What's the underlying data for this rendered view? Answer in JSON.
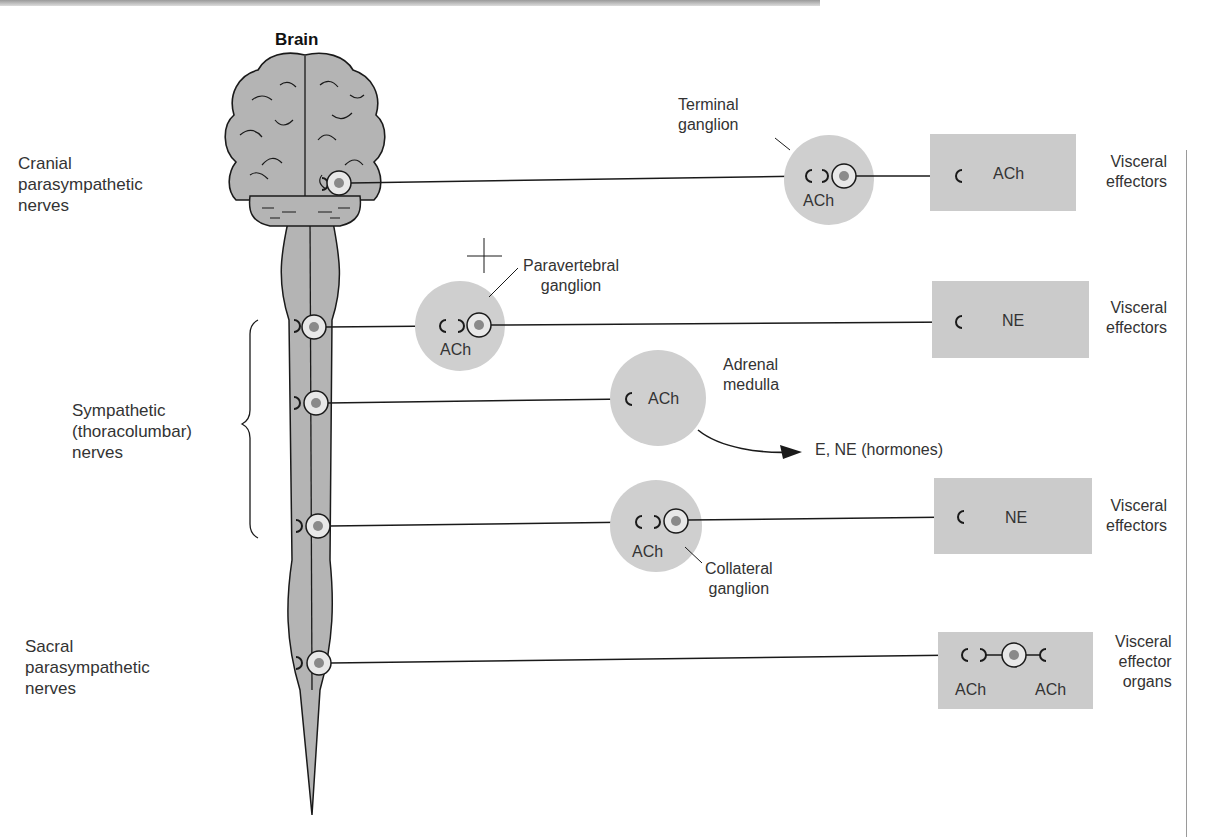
{
  "title": "Brain",
  "colors": {
    "background": "#ffffff",
    "tissue_gray": "#b4b4b4",
    "ganglion_gray": "#cfcfcf",
    "effector_box_gray": "#cbcbcb",
    "cell_body_fill": "#e8e8e8",
    "nucleus": "#8a8a8a",
    "line": "#1a1a1a"
  },
  "left_labels": {
    "cranial": [
      "Cranial",
      "parasympathetic",
      "nerves"
    ],
    "sympathetic": [
      "Sympathetic",
      "(thoracolumbar)",
      "nerves"
    ],
    "sacral": [
      "Sacral",
      "parasympathetic",
      "nerves"
    ]
  },
  "pathways": [
    {
      "id": "cranial-parasympathetic",
      "ganglion_label": [
        "Terminal",
        "ganglion"
      ],
      "ganglion_transmitter": "ACh",
      "effector_transmitter": "ACh",
      "effector_label": [
        "Visceral",
        "effectors"
      ]
    },
    {
      "id": "sympathetic-paravertebral",
      "ganglion_label": [
        "Paravertebral",
        "ganglion"
      ],
      "ganglion_transmitter": "ACh",
      "effector_transmitter": "NE",
      "effector_label": [
        "Visceral",
        "effectors"
      ]
    },
    {
      "id": "sympathetic-adrenal",
      "ganglion_label": [
        "Adrenal",
        "medulla"
      ],
      "ganglion_transmitter": "ACh",
      "output_label": "E, NE (hormones)"
    },
    {
      "id": "sympathetic-collateral",
      "ganglion_label": [
        "Collateral",
        "ganglion"
      ],
      "ganglion_transmitter": "ACh",
      "effector_transmitter": "NE",
      "effector_label": [
        "Visceral",
        "effectors"
      ]
    },
    {
      "id": "sacral-parasympathetic",
      "effector_transmitters": [
        "ACh",
        "ACh"
      ],
      "effector_label": [
        "Visceral",
        "effector",
        "organs"
      ]
    }
  ]
}
